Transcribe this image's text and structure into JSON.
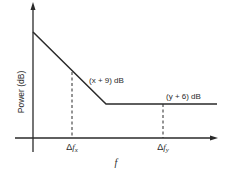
{
  "diagram": {
    "y_axis_label": "Power (dB)",
    "x_axis_label": "f",
    "annotations": {
      "upper": "(x + 9) dB",
      "lower": "(y + 6) dB"
    },
    "ticks": {
      "dfx_delta": "Δ",
      "dfx_f": "f",
      "dfx_sub": "x",
      "dfy_delta": "Δ",
      "dfy_f": "f",
      "dfy_sub": "y"
    },
    "colors": {
      "line": "#2a2a2a",
      "background": "#ffffff"
    }
  }
}
